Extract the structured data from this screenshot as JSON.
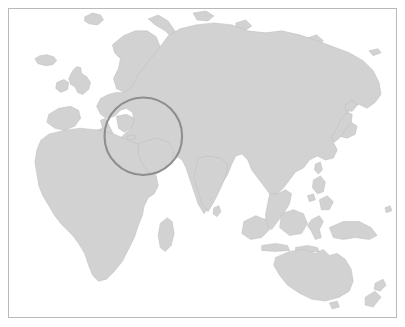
{
  "figure": {
    "kind": "world-map-eastern-hemisphere",
    "title": "World map with highlighted region",
    "width": 405,
    "height": 327,
    "background_color": "#ffffff",
    "border_color": "#b9b9b9",
    "land_fill_color": "#d2d2d2",
    "land_stroke_color": "#bdbdbd",
    "ocean_color": "#ffffff"
  },
  "annotation": {
    "type": "circle",
    "label": "Middle East highlight",
    "stroke_color": "#8e8e8e",
    "stroke_width": 2.1,
    "center_x": 143,
    "center_y": 136,
    "radius": 39,
    "covers": "Middle East, Arabian Peninsula, Red Sea, Persian Gulf, Caspian Sea"
  },
  "regions": [
    {
      "name": "Europe"
    },
    {
      "name": "Scandinavia"
    },
    {
      "name": "British Isles"
    },
    {
      "name": "Iceland"
    },
    {
      "name": "Africa"
    },
    {
      "name": "Madagascar"
    },
    {
      "name": "Arabian Peninsula"
    },
    {
      "name": "Russia / Siberia"
    },
    {
      "name": "India"
    },
    {
      "name": "Sri Lanka"
    },
    {
      "name": "China"
    },
    {
      "name": "Japan"
    },
    {
      "name": "Southeast Asia"
    },
    {
      "name": "Philippines"
    },
    {
      "name": "Indonesia"
    },
    {
      "name": "New Guinea"
    },
    {
      "name": "Australia"
    },
    {
      "name": "Tasmania"
    },
    {
      "name": "New Zealand"
    }
  ]
}
